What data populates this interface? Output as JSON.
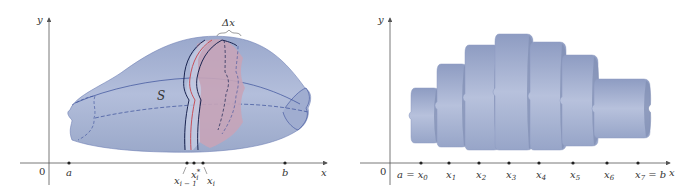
{
  "colors": {
    "solid_fill": "#a7b3d2",
    "solid_fill_dark": "#8d9bc2",
    "solid_outline": "#3a4f9a",
    "slab_fill": "#c9a5b6",
    "slab_edge_red": "#c8505a",
    "slab_edge_dark": "#1a2450",
    "axis": "#555555",
    "stack_fill": "#a9b5d0",
    "stack_shadow": "#7f8db2"
  },
  "left_figure": {
    "y_axis_label": "y",
    "x_axis_label": "x",
    "origin_label": "0",
    "solid_label": "S",
    "width_label": "Δx",
    "ticks": [
      {
        "name": "a",
        "label": "a"
      },
      {
        "name": "x_i_minus_1",
        "label": "x",
        "sub": "i − 1"
      },
      {
        "name": "x_i_star",
        "label": "x",
        "sub": "i",
        "sup": "*"
      },
      {
        "name": "x_i",
        "label": "x",
        "sub": "i"
      },
      {
        "name": "b",
        "label": "b"
      }
    ]
  },
  "right_figure": {
    "y_axis_label": "y",
    "x_axis_label": "x",
    "origin_label": "0",
    "ticks": [
      {
        "label": "a = x",
        "sub": "0"
      },
      {
        "label": "x",
        "sub": "1"
      },
      {
        "label": "x",
        "sub": "2"
      },
      {
        "label": "x",
        "sub": "3"
      },
      {
        "label": "x",
        "sub": "4"
      },
      {
        "label": "x",
        "sub": "5"
      },
      {
        "label": "x",
        "sub": "6"
      },
      {
        "label": "x",
        "sub": "7",
        "suffix": " = b"
      }
    ],
    "slab_count": 7
  }
}
